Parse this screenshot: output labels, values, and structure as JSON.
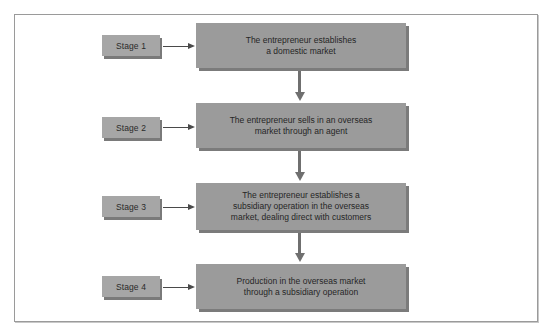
{
  "diagram": {
    "type": "flowchart",
    "colors": {
      "box_face": "#9b9b9b",
      "box_shadow": "#7b7b7b",
      "stage_face": "#a6a6a6",
      "frame": "#9a9a9a",
      "arrow": "#4a4a4a"
    },
    "stages": [
      {
        "label": "Stage 1",
        "description": "The entrepreneur establishes\na domestic market"
      },
      {
        "label": "Stage 2",
        "description": "The entrepreneur sells in an overseas\nmarket through an agent"
      },
      {
        "label": "Stage 3",
        "description": "The entrepreneur establishes a\nsubsidiary operation in the overseas\nmarket, dealing direct with customers"
      },
      {
        "label": "Stage 4",
        "description": "Production in the overseas market\nthrough a subsidiary operation"
      }
    ]
  }
}
